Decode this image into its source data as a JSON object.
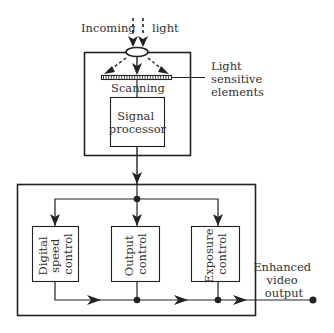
{
  "diagram": {
    "type": "block-diagram",
    "colors": {
      "line": "#222222",
      "text": "#333333",
      "background": "#ffffff"
    },
    "labels": {
      "incoming_left": "Incoming",
      "incoming_right": "light",
      "scanning_left": "Scan",
      "scanning_right": "ning",
      "light_sensitive": [
        "Light",
        "sensitive",
        "elements"
      ],
      "signal_processor": [
        "Signal",
        "processor"
      ],
      "digital_speed_control": [
        "Digital",
        "speed",
        "control"
      ],
      "output_control": [
        "Output",
        "control"
      ],
      "exposure_control": [
        "Exposure",
        "control"
      ],
      "enhanced_output": [
        "Enhanced",
        "video",
        "output"
      ]
    },
    "nodes": [
      {
        "id": "lens",
        "label": "",
        "kind": "lens"
      },
      {
        "id": "sensor",
        "label": "Light sensitive elements",
        "kind": "sensor-array"
      },
      {
        "id": "signal_processor",
        "label": "Signal processor",
        "kind": "block"
      },
      {
        "id": "digital_speed_control",
        "label": "Digital speed control",
        "kind": "block"
      },
      {
        "id": "output_control",
        "label": "Output control",
        "kind": "block"
      },
      {
        "id": "exposure_control",
        "label": "Exposure control",
        "kind": "block"
      },
      {
        "id": "output_terminal",
        "label": "Enhanced video output",
        "kind": "terminal"
      }
    ],
    "edges": [
      {
        "from": "incoming_light",
        "to": "lens"
      },
      {
        "from": "lens",
        "to": "sensor"
      },
      {
        "from": "sensor",
        "to": "signal_processor",
        "label": "Scanning"
      },
      {
        "from": "signal_processor",
        "to": "digital_speed_control"
      },
      {
        "from": "signal_processor",
        "to": "output_control"
      },
      {
        "from": "signal_processor",
        "to": "exposure_control"
      },
      {
        "from": "digital_speed_control",
        "to": "output_terminal"
      },
      {
        "from": "output_control",
        "to": "output_terminal"
      },
      {
        "from": "exposure_control",
        "to": "output_terminal"
      }
    ]
  }
}
